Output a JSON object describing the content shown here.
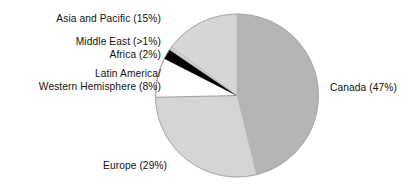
{
  "chart_data": {
    "type": "pie",
    "title": "",
    "subtitle": "",
    "xlabel": "",
    "ylabel": "",
    "legend_position": "none",
    "grid": false,
    "label_style": "outside-callout",
    "start_angle_deg": 0,
    "direction": "clockwise",
    "categories": [
      "Canada",
      "Europe",
      "Latin America/Western Hemisphere",
      "Africa",
      "Middle East",
      "Asia and Pacific"
    ],
    "values": [
      47,
      29,
      8,
      2,
      0.8,
      15
    ],
    "value_labels": [
      "47%",
      "29%",
      "8%",
      "2%",
      ">1%",
      "15%"
    ],
    "slices": [
      {
        "name": "Canada",
        "value": 47,
        "display": "47%",
        "color": "#b5b5b5"
      },
      {
        "name": "Europe",
        "value": 29,
        "display": "29%",
        "color": "#d5d5d5"
      },
      {
        "name": "Latin America/Western Hemisphere",
        "value": 8,
        "display": "8%",
        "color": "#ffffff"
      },
      {
        "name": "Africa",
        "value": 2,
        "display": "2%",
        "color": "#000000"
      },
      {
        "name": "Middle East",
        "value": 0.8,
        "display": ">1%",
        "color": "#cfcfcf"
      },
      {
        "name": "Asia and Pacific",
        "value": 15,
        "display": "15%",
        "color": "#d6d6d6"
      }
    ]
  },
  "labels": {
    "asia": "Asia and Pacific (15%)",
    "middle_east": "Middle East (>1%)",
    "africa": "Africa (2%)",
    "latin_america_line1": "Latin America/",
    "latin_america_line2": "Western Hemisphere (8%)",
    "canada": "Canada (47%)",
    "europe": "Europe (29%)"
  },
  "colors": {
    "canada": "#b5b5b5",
    "europe": "#d5d5d5",
    "asia": "#d6d6d6",
    "latin_america": "#ffffff",
    "africa": "#000000",
    "middle_east": "#cfcfcf",
    "outline": "#8e8e8e",
    "background": "#ffffff",
    "text": "#111111"
  }
}
